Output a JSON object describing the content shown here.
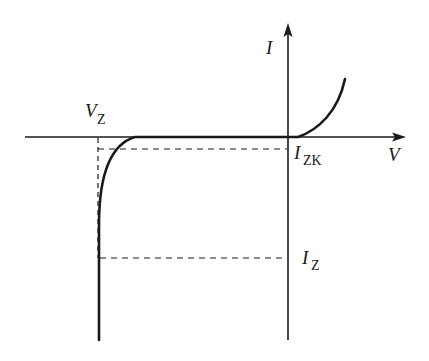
{
  "diagram": {
    "axes": {
      "x_label": "V",
      "y_label": "I"
    },
    "labels": {
      "vz_main": "V",
      "vz_sub": "Z",
      "izk_main": "I",
      "izk_sub": "ZK",
      "iz_main": "I",
      "iz_sub": "Z"
    },
    "colors": {
      "line": "#1a1a1a",
      "background": "#ffffff"
    }
  }
}
